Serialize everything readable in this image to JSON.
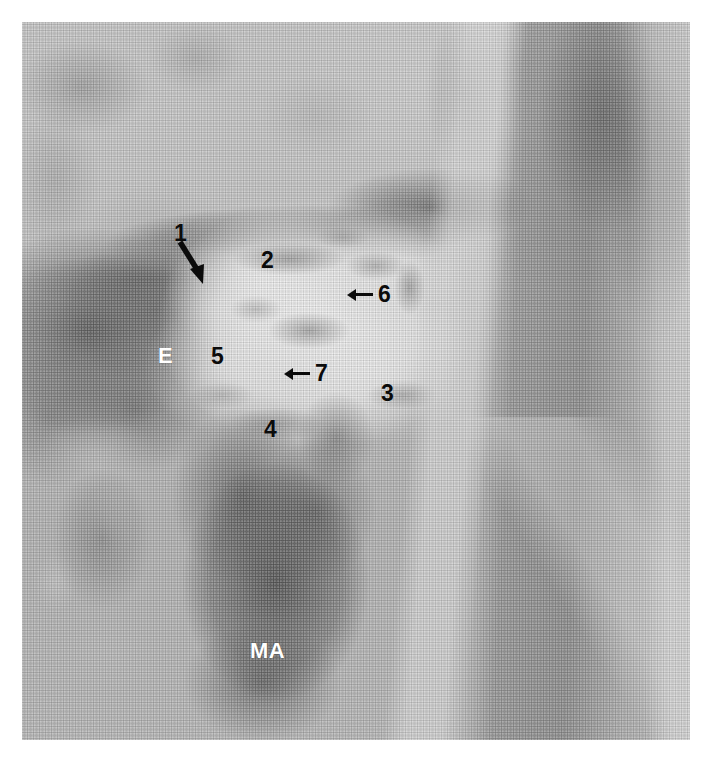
{
  "figure": {
    "type": "grayscale-medical-scan",
    "modality": "ultrasound/MRI halftone print",
    "region": "parotid region",
    "plate": {
      "left": 22,
      "top": 22,
      "width": 668,
      "height": 718,
      "background_color": "#b9b9b9",
      "page_background": "#ffffff"
    }
  },
  "annotations": {
    "label_1": "1",
    "label_2": "2",
    "label_3": "3",
    "label_4": "4",
    "label_5": "5",
    "label_6": "6",
    "label_7": "7",
    "label_e": "E",
    "label_ma": "MA"
  },
  "annotation_styles": {
    "dark_text_color": "#0b0b0b",
    "light_text_color": "#ffffff",
    "arrow_color": "#0b0b0b"
  },
  "annotation_list": [
    {
      "text": "1",
      "x": 174,
      "y": 222,
      "color": "dark",
      "marker": "diagonal-arrow-down-right"
    },
    {
      "text": "2",
      "x": 261,
      "y": 249,
      "color": "dark",
      "marker": "none"
    },
    {
      "text": "6",
      "x": 370,
      "y": 283,
      "color": "dark",
      "marker": "left-arrow"
    },
    {
      "text": "E",
      "x": 158,
      "y": 345,
      "color": "light",
      "marker": "none"
    },
    {
      "text": "5",
      "x": 211,
      "y": 345,
      "color": "dark",
      "marker": "none"
    },
    {
      "text": "7",
      "x": 307,
      "y": 362,
      "color": "dark",
      "marker": "left-arrow"
    },
    {
      "text": "3",
      "x": 381,
      "y": 382,
      "color": "dark",
      "marker": "none"
    },
    {
      "text": "4",
      "x": 264,
      "y": 418,
      "color": "dark",
      "marker": "none"
    },
    {
      "text": "MA",
      "x": 250,
      "y": 640,
      "color": "light",
      "marker": "none"
    }
  ]
}
